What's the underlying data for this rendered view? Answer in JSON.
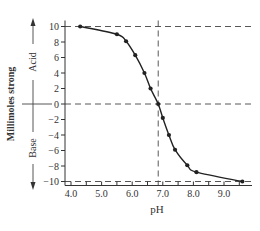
{
  "chart_data": {
    "type": "line",
    "title": "",
    "xlabel": "pH",
    "ylabel": "Millimoles strong",
    "ylabel_upper": "Acid",
    "ylabel_lower": "Base",
    "xlim": [
      4.0,
      9.7
    ],
    "ylim": [
      -10,
      10
    ],
    "x_ticks": [
      4.0,
      5.0,
      6.0,
      7.0,
      8.0,
      9.0
    ],
    "x_tick_labels": [
      "4.0",
      "5.0",
      "6.0",
      "7.0",
      "8.0",
      "9.0"
    ],
    "x_minor_step": 0.5,
    "y_ticks": [
      10,
      8,
      6,
      4,
      2,
      0,
      -2,
      -4,
      -6,
      -8,
      -10
    ],
    "y_tick_labels": [
      "10",
      "8",
      "6",
      "4",
      "2",
      "0",
      "−2",
      "−4",
      "−6",
      "−8",
      "−10"
    ],
    "grid": false,
    "reference_lines": {
      "horizontal": [
        10,
        0,
        -10
      ],
      "vertical": [
        6.85
      ]
    },
    "series": [
      {
        "name": "titration curve",
        "marker": "circle",
        "x": [
          4.3,
          5.5,
          5.8,
          6.1,
          6.4,
          6.6,
          6.85,
          7.0,
          7.2,
          7.4,
          7.8,
          8.1,
          9.6
        ],
        "y": [
          10.0,
          9.0,
          8.1,
          6.3,
          4.0,
          2.0,
          0.0,
          -1.8,
          -4.0,
          -5.9,
          -7.9,
          -8.8,
          -10.0
        ]
      }
    ]
  }
}
